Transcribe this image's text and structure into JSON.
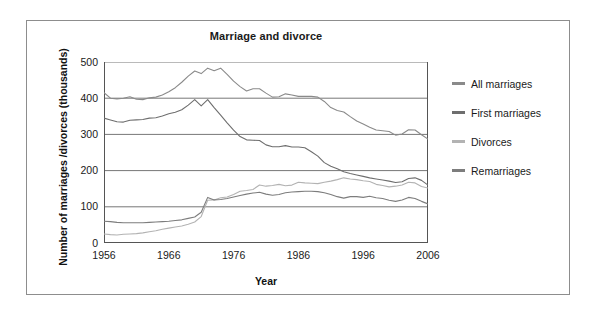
{
  "chart_data": {
    "type": "line",
    "title": "Marriage and divorce",
    "xlabel": "Year",
    "ylabel": "Number of marriages /divorces (thousands)",
    "xlim": [
      1956,
      2006
    ],
    "ylim": [
      0,
      500
    ],
    "grid": true,
    "legend_position": "right",
    "x_ticks": [
      "1956",
      "1966",
      "1976",
      "1986",
      "1996",
      "2006"
    ],
    "x_tick_values": [
      1956,
      1966,
      1976,
      1986,
      1996,
      2006
    ],
    "y_ticks": [
      "0",
      "100",
      "200",
      "300",
      "400",
      "500"
    ],
    "y_tick_values": [
      0,
      100,
      200,
      300,
      400,
      500
    ],
    "x": [
      1956,
      1957,
      1958,
      1959,
      1960,
      1961,
      1962,
      1963,
      1964,
      1965,
      1966,
      1967,
      1968,
      1969,
      1970,
      1971,
      1972,
      1973,
      1974,
      1975,
      1976,
      1977,
      1978,
      1979,
      1980,
      1981,
      1982,
      1983,
      1984,
      1985,
      1986,
      1987,
      1988,
      1989,
      1990,
      1991,
      1992,
      1993,
      1994,
      1995,
      1996,
      1997,
      1998,
      1999,
      2000,
      2001,
      2002,
      2003,
      2004,
      2005,
      2006
    ],
    "series": [
      {
        "name": "All marriages",
        "color": "#8a8a8a",
        "values": [
          415,
          400,
          398,
          400,
          404,
          397,
          396,
          401,
          403,
          409,
          418,
          429,
          444,
          461,
          475,
          468,
          483,
          476,
          483,
          466,
          447,
          432,
          420,
          426,
          426,
          414,
          403,
          404,
          412,
          409,
          405,
          405,
          405,
          403,
          391,
          374,
          366,
          362,
          349,
          337,
          329,
          320,
          312,
          310,
          308,
          298,
          301,
          313,
          312,
          299,
          287
        ]
      },
      {
        "name": "First marriages",
        "color": "#6e6e6e",
        "values": [
          345,
          340,
          335,
          334,
          339,
          340,
          341,
          345,
          346,
          351,
          357,
          361,
          368,
          381,
          396,
          379,
          396,
          374,
          353,
          332,
          312,
          294,
          285,
          284,
          283,
          271,
          266,
          266,
          269,
          265,
          265,
          263,
          252,
          240,
          222,
          212,
          205,
          197,
          192,
          188,
          184,
          180,
          177,
          174,
          171,
          167,
          169,
          178,
          180,
          173,
          160
        ]
      },
      {
        "name": "Divorces",
        "color": "#b3b3b3",
        "values": [
          25,
          23,
          22,
          24,
          25,
          26,
          28,
          31,
          34,
          38,
          41,
          44,
          47,
          52,
          58,
          73,
          118,
          119,
          125,
          127,
          134,
          143,
          145,
          148,
          160,
          157,
          159,
          162,
          158,
          160,
          168,
          166,
          165,
          164,
          168,
          171,
          175,
          180,
          177,
          175,
          172,
          170,
          162,
          159,
          155,
          157,
          160,
          168,
          166,
          156,
          152
        ]
      },
      {
        "name": "Remarriages",
        "color": "#7d7d7d",
        "values": [
          60,
          59,
          57,
          56,
          56,
          56,
          56,
          57,
          58,
          59,
          60,
          62,
          64,
          68,
          72,
          85,
          126,
          119,
          120,
          123,
          127,
          131,
          135,
          138,
          140,
          135,
          132,
          134,
          139,
          141,
          142,
          143,
          143,
          142,
          139,
          134,
          128,
          124,
          128,
          128,
          126,
          129,
          125,
          123,
          118,
          115,
          119,
          126,
          123,
          115,
          108
        ]
      }
    ]
  },
  "legend": {
    "items": [
      {
        "label": "All marriages",
        "color": "#8a8a8a",
        "icon": "line-swatch-icon"
      },
      {
        "label": "First marriages",
        "color": "#6e6e6e",
        "icon": "line-swatch-icon"
      },
      {
        "label": "Divorces",
        "color": "#b3b3b3",
        "icon": "line-swatch-icon"
      },
      {
        "label": "Remarriages",
        "color": "#7d7d7d",
        "icon": "line-swatch-icon"
      }
    ]
  },
  "colors": {
    "frame_border": "#8d8d8d",
    "axis": "#555555",
    "gridline": "#777777",
    "text": "#1a1a1a",
    "background": "#ffffff"
  }
}
